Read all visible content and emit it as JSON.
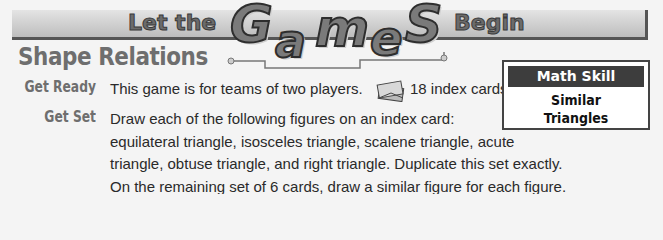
{
  "banner": {
    "prefix": "Let the",
    "big_letters": [
      "G",
      "a",
      "m",
      "e",
      "S"
    ],
    "suffix": "Begin"
  },
  "title": "Shape Relations",
  "get_ready": {
    "label": "Get Ready",
    "text": "This game is for teams of two players.",
    "materials": {
      "icon": "index-cards-icon",
      "text": "18 index cards"
    }
  },
  "get_set": {
    "label": "Get Set",
    "lines": [
      "Draw each of the following figures on an index card:",
      "equilateral triangle, isosceles triangle, scalene triangle, acute",
      "triangle, obtuse triangle, and right triangle. Duplicate this set exactly.",
      "On the remaining set of 6 cards, draw a similar figure for each figure."
    ]
  },
  "math_skill": {
    "header": "Math Skill",
    "skill_lines": [
      "Similar",
      "Triangles"
    ]
  }
}
